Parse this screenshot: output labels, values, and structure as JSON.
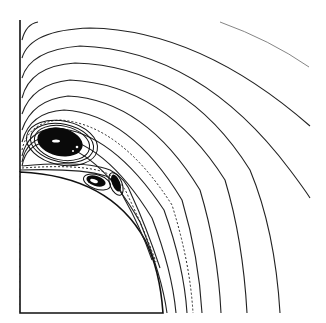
{
  "figure": {
    "kind": "streamline plot",
    "description": "Steady streamlines of flow past a sphere (quarter view) showing a recirculating vortex region near the body",
    "colors": {
      "background": "#ffffff",
      "streamline": "#222222",
      "vortex_core": "#0a0a0a"
    },
    "elements": {
      "symmetry_axis": "vertical axis on left edge",
      "body": "quarter-circle sphere surface, lower left",
      "main_vortex": "large closed-streamline eddy above the sphere",
      "secondary_vortices": "two small eddies near sphere surface",
      "dashed_streamline": "dividing streamline (dashed)",
      "outer_streamlines": "11 open streamlines wrapping around the body"
    }
  }
}
